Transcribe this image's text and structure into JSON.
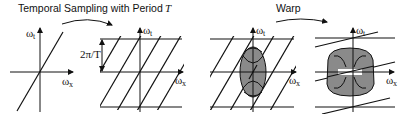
{
  "captions": {
    "sampling": "Temporal Sampling with Period ",
    "sampling_var": "T",
    "warp": "Warp"
  },
  "axes": {
    "omega": "ω",
    "t_sub": "t",
    "x_sub": "x"
  },
  "period_label": "2π/T",
  "panels": [
    {
      "id": "original-spectrum",
      "description": "Single line spectrum through origin"
    },
    {
      "id": "sampled-spectrum",
      "description": "Replicated spectra spaced 2π/T in ω_t"
    },
    {
      "id": "sampled-with-filter",
      "description": "Replicas with vertical elliptical reconstruction filter"
    },
    {
      "id": "warped-with-filter",
      "description": "Warped replicas with wide rounded reconstruction filter"
    }
  ],
  "colors": {
    "ink": "#111111",
    "filter_fill": "#8a8a8a",
    "background": "#ffffff"
  }
}
